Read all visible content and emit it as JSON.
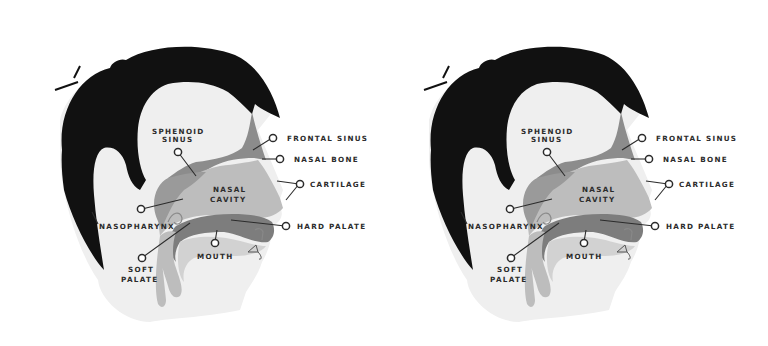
{
  "diagram": {
    "copies": 2,
    "colors": {
      "background": "#ffffff",
      "skin": "#efefef",
      "hair": "#111111",
      "tissue_light": "#bdbdbd",
      "tissue_mid": "#9a9a9a",
      "tissue_dark": "#7d7d7d",
      "label_text": "#2b2b2b"
    },
    "labels": {
      "sphenoid_1": "SPHENOID",
      "sphenoid_2": "SINUS",
      "frontal_sinus": "FRONTAL SINUS",
      "nasal_bone": "NASAL BONE",
      "nasal_cavity_1": "NASAL",
      "nasal_cavity_2": "CAVITY",
      "cartilage": "CARTILAGE",
      "nasopharynx": "NASOPHARYNX",
      "hard_palate": "HARD PALATE",
      "mouth": "MOUTH",
      "soft_palate_1": "SOFT",
      "soft_palate_2": "PALATE"
    }
  }
}
